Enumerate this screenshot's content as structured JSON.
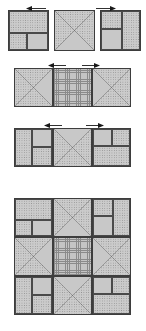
{
  "figure": {
    "canvas": {
      "width": 146,
      "height": 331,
      "background": "#ffffff"
    }
  },
  "palette": {
    "plain": "#c8c8c8",
    "dotted": "#cbcbcb",
    "dotted_speck": "#8e8e8e",
    "grid": "#c4c4c4",
    "grid_line": "#8a8a8a",
    "outline": "#3d3d3d",
    "arrow": "#1a1a1a"
  },
  "legend": {
    "fills": [
      {
        "key": "plain",
        "label": "solid light grey"
      },
      {
        "key": "dot",
        "label": "dotted print"
      },
      {
        "key": "grid",
        "label": "cross-hatch plaid"
      }
    ]
  },
  "arrows": [
    {
      "name": "arrow-row1-left",
      "direction": "left",
      "x": 26,
      "y": 5,
      "length": 20
    },
    {
      "name": "arrow-row1-right",
      "direction": "right",
      "x": 96,
      "y": 5,
      "length": 20
    },
    {
      "name": "arrow-row2-left",
      "direction": "left",
      "x": 48,
      "y": 62,
      "length": 18
    },
    {
      "name": "arrow-row2-right",
      "direction": "right",
      "x": 82,
      "y": 62,
      "length": 18
    },
    {
      "name": "arrow-row3-left",
      "direction": "left",
      "x": 44,
      "y": 122,
      "length": 18
    },
    {
      "name": "arrow-row3-right",
      "direction": "right",
      "x": 86,
      "y": 122,
      "length": 18
    }
  ],
  "units": {
    "corner_a": {
      "name": "corner-block-a",
      "type": "four-patch-corner",
      "parts": [
        {
          "name": "top-band",
          "fill": "dot",
          "x": 0,
          "y": 0,
          "w": 1,
          "h": 0.56
        },
        {
          "name": "bottom-left",
          "fill": "dot",
          "x": 0,
          "y": 0.56,
          "w": 0.45,
          "h": 0.44
        },
        {
          "name": "bottom-right",
          "fill": "plain",
          "x": 0.45,
          "y": 0.56,
          "w": 0.55,
          "h": 0.44
        }
      ]
    },
    "corner_b": {
      "name": "corner-block-b",
      "type": "four-patch-corner",
      "parts": [
        {
          "name": "left-top",
          "fill": "dot",
          "x": 0,
          "y": 0,
          "w": 0.55,
          "h": 0.45
        },
        {
          "name": "left-bottom",
          "fill": "plain",
          "x": 0,
          "y": 0.45,
          "w": 0.55,
          "h": 0.55
        },
        {
          "name": "right-band",
          "fill": "dot",
          "x": 0.55,
          "y": 0,
          "w": 0.45,
          "h": 1
        }
      ]
    },
    "corner_c": {
      "name": "corner-block-c",
      "type": "four-patch-corner",
      "parts": [
        {
          "name": "left-band",
          "fill": "dot",
          "x": 0,
          "y": 0,
          "w": 0.45,
          "h": 1
        },
        {
          "name": "right-top",
          "fill": "plain",
          "x": 0.45,
          "y": 0,
          "w": 0.55,
          "h": 0.48
        },
        {
          "name": "right-bottom",
          "fill": "dot",
          "x": 0.45,
          "y": 0.48,
          "w": 0.55,
          "h": 0.52
        }
      ]
    },
    "corner_d": {
      "name": "corner-block-d",
      "type": "four-patch-corner",
      "parts": [
        {
          "name": "top-left",
          "fill": "plain",
          "x": 0,
          "y": 0,
          "w": 0.5,
          "h": 0.45
        },
        {
          "name": "top-right",
          "fill": "dot",
          "x": 0.5,
          "y": 0,
          "w": 0.5,
          "h": 0.45
        },
        {
          "name": "bottom-band",
          "fill": "dot",
          "x": 0,
          "y": 0.45,
          "w": 1,
          "h": 0.55
        }
      ]
    },
    "star_n": {
      "name": "star-point-north",
      "type": "quarter-square-triangle",
      "triangles": {
        "north": "dot",
        "east": "dot",
        "south": "plain",
        "west": "dot"
      }
    },
    "star_w": {
      "name": "star-point-west",
      "type": "quarter-square-triangle",
      "triangles": {
        "north": "dot",
        "east": "plain",
        "south": "dot",
        "west": "dot"
      }
    },
    "star_e": {
      "name": "star-point-east",
      "type": "quarter-square-triangle",
      "triangles": {
        "north": "dot",
        "east": "dot",
        "south": "dot",
        "west": "plain"
      }
    },
    "star_s": {
      "name": "star-point-south",
      "type": "quarter-square-triangle",
      "triangles": {
        "north": "plain",
        "east": "dot",
        "south": "dot",
        "west": "dot"
      }
    },
    "center": {
      "name": "center-square",
      "type": "plain-square",
      "fill": "grid"
    }
  },
  "rows": [
    {
      "name": "assembly-row-1",
      "label": "Row 1",
      "x": 8,
      "y": 10,
      "cell": 41,
      "gap": 5,
      "cells": [
        "corner_a",
        "star_n",
        "corner_b"
      ]
    },
    {
      "name": "assembly-row-2",
      "label": "Row 2",
      "x": 14,
      "y": 68,
      "cell": 39,
      "gap": 0,
      "cells": [
        "star_w",
        "center",
        "star_e"
      ]
    },
    {
      "name": "assembly-row-3",
      "label": "Row 3",
      "x": 14,
      "y": 128,
      "cell": 39,
      "gap": 0,
      "cells": [
        "corner_c",
        "star_s",
        "corner_d"
      ]
    }
  ],
  "final_block": {
    "name": "completed-block",
    "label": "Completed block",
    "x": 14,
    "y": 198,
    "cell": 39,
    "grid": [
      [
        "corner_a",
        "star_n",
        "corner_b"
      ],
      [
        "star_w",
        "center",
        "star_e"
      ],
      [
        "corner_c",
        "star_s",
        "corner_d"
      ]
    ]
  }
}
